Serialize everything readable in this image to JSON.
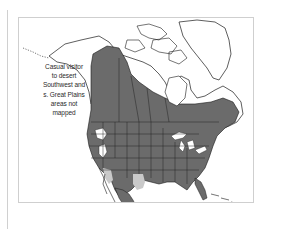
{
  "map": {
    "title": "Range map",
    "region": "North America",
    "colors": {
      "range": "#6b6b6b",
      "secondary_range": "#c9c9c9",
      "land": "#ffffff",
      "water": "#ffffff",
      "outline": "#1a1a1a",
      "frame": "#cfcfcf"
    },
    "legend": [
      {
        "label": "Range",
        "color": "#6b6b6b"
      },
      {
        "label": "Secondary range",
        "color": "#c9c9c9"
      }
    ],
    "annotation": {
      "lines": [
        "Casual visitor",
        "to desert",
        "Southwest and",
        "s. Great Plains",
        "areas not",
        "mapped"
      ]
    }
  }
}
